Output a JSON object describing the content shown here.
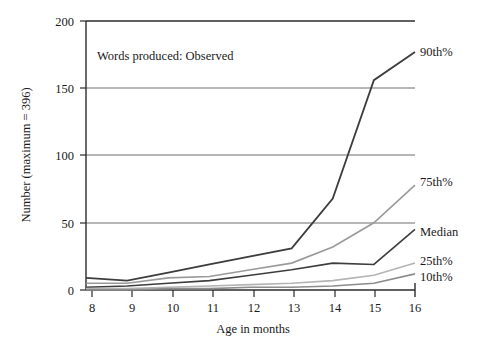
{
  "chart_data": {
    "type": "line",
    "title": "",
    "annotation": "Words produced: Observed",
    "xlabel": "Age in months",
    "ylabel": "Number (maximum = 396)",
    "x": [
      8,
      9,
      10,
      11,
      12,
      13,
      14,
      15,
      16
    ],
    "xlim": [
      8,
      16
    ],
    "ylim": [
      0,
      200
    ],
    "xticks": [
      "8",
      "9",
      "10",
      "11",
      "12",
      "13",
      "14",
      "15",
      "16"
    ],
    "yticks": [
      "0",
      "50",
      "100",
      "150",
      "200"
    ],
    "grid": "horizontal",
    "legend_position": "right-inline-labels",
    "series": [
      {
        "name": "90th%",
        "label": "90th%",
        "color": "#3d3d3d",
        "width": 1.8,
        "values": [
          9,
          7,
          13,
          19,
          25,
          31,
          68,
          156,
          177
        ]
      },
      {
        "name": "75th%",
        "label": "75th%",
        "color": "#9a9a9a",
        "width": 1.6,
        "values": [
          5,
          5,
          9,
          10,
          15,
          20,
          32,
          50,
          78
        ]
      },
      {
        "name": "Median",
        "label": "Median",
        "color": "#3d3d3d",
        "width": 1.6,
        "values": [
          2,
          3,
          5,
          7,
          11,
          15,
          20,
          19,
          45
        ]
      },
      {
        "name": "25th%",
        "label": "25th%",
        "color": "#b4b4b4",
        "width": 1.6,
        "values": [
          1,
          1,
          2,
          3,
          4,
          5,
          7,
          11,
          20
        ]
      },
      {
        "name": "10th%",
        "label": "10th%",
        "color": "#8c8c8c",
        "width": 1.6,
        "values": [
          0,
          0,
          1,
          1,
          2,
          2,
          3,
          5,
          12
        ]
      }
    ]
  },
  "labels": {
    "series_label_90": "90th%",
    "series_label_75": "75th%",
    "series_label_median": "Median",
    "series_label_25": "25th%",
    "series_label_10": "10th%"
  },
  "colors": {
    "axis": "#2b2b2b",
    "grid": "#6e6e6e",
    "background": "#ffffff",
    "text": "#1a1a1a"
  }
}
